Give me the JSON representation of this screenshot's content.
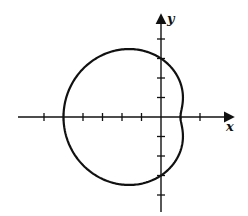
{
  "diagram": {
    "type": "polar-curve",
    "curve": "limacon r = 3 - 2cos(theta)",
    "axes": {
      "x_label": "x",
      "y_label": "y"
    },
    "x_ticks": [
      -6,
      -5,
      -4,
      -3,
      -2,
      -1,
      1,
      2
    ],
    "y_ticks": [
      -4,
      -3,
      -2,
      -1,
      1,
      2,
      3,
      4
    ],
    "intercepts": {
      "x": [
        -5,
        1
      ],
      "y": [
        3,
        -3
      ]
    }
  },
  "colors": {
    "stroke": "#111111",
    "background": "#ffffff"
  }
}
